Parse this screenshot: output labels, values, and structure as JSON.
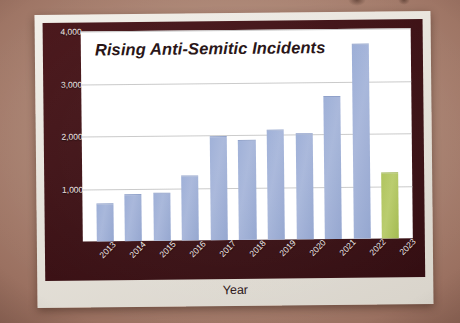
{
  "chart_data": {
    "type": "bar",
    "title": "Rising Anti-Semitic Incidents",
    "xlabel": "Year",
    "ylabel": "Number of Incidents",
    "categories": [
      "2013",
      "2014",
      "2015",
      "2016",
      "2017",
      "2018",
      "2019",
      "2020",
      "2021",
      "2022",
      "2023"
    ],
    "values": [
      700,
      880,
      900,
      1220,
      1970,
      1880,
      2070,
      2000,
      2700,
      3700,
      1230
    ],
    "ylim": [
      0,
      4000
    ],
    "yticks": [
      1000,
      2000,
      3000,
      4000
    ],
    "ytick_labels": [
      "1,000",
      "2,000",
      "3,000",
      "4,000"
    ],
    "grid": true,
    "legend": "none",
    "bar_colors": [
      "#9badd6",
      "#9badd6",
      "#9badd6",
      "#9badd6",
      "#9badd6",
      "#9badd6",
      "#9badd6",
      "#9badd6",
      "#9badd6",
      "#9badd6",
      "#aec35a"
    ],
    "highlight_category": "2023",
    "highlight_color": "#aec35a",
    "series_color": "#9badd6"
  },
  "theme": {
    "frame_color": "#3c1115",
    "panel_color": "#ffffff",
    "paper_color": "#eeeae3",
    "backdrop_color": "#a8826f",
    "tick_label_color": "#f0e8e6",
    "axis_title_color": "#2a1416",
    "title_color": "#241012",
    "gridline_color": "#c9c9c9"
  }
}
